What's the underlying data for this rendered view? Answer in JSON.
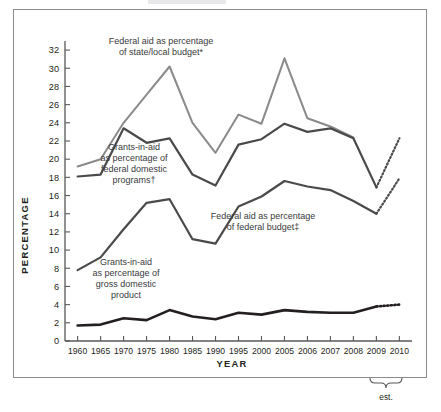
{
  "figure": {
    "frame_border_color": "#8c8c8e",
    "background": "#ffffff"
  },
  "axes": {
    "y_title": "PERCENTAGE",
    "x_title": "YEAR",
    "y_ticks": [
      0,
      2,
      4,
      6,
      8,
      10,
      12,
      14,
      16,
      18,
      20,
      22,
      24,
      26,
      28,
      30,
      32
    ],
    "x_ticks": [
      "1960",
      "1965",
      "1970",
      "1975",
      "1980",
      "1985",
      "1990",
      "1995",
      "2000",
      "2005",
      "2006",
      "2007",
      "2008",
      "2009",
      "2010"
    ],
    "est_bracket_label": "est."
  },
  "annotations": {
    "state_local": {
      "line1": "Federal aid as percentage",
      "line2": "of state/local budget*"
    },
    "domestic_programs": {
      "line1": "Grants-in-aid",
      "line2": "as percentage of",
      "line3": "federal domestic",
      "line4": "programs†"
    },
    "federal_budget": {
      "line1": "Federal aid as percentage",
      "line2": "of federal budget‡"
    },
    "gdp": {
      "line1": "Grants-in-aid",
      "line2": "as percentage of",
      "line3": "gross domestic",
      "line4": "product"
    }
  },
  "chart_data": {
    "type": "line",
    "title": "",
    "xlabel": "YEAR",
    "ylabel": "PERCENTAGE",
    "ylim": [
      0,
      33
    ],
    "grid": false,
    "legend_position": "inline-annotations",
    "categories": [
      "1960",
      "1965",
      "1970",
      "1975",
      "1980",
      "1985",
      "1990",
      "1995",
      "2000",
      "2005",
      "2006",
      "2007",
      "2008",
      "2009",
      "2010"
    ],
    "series": [
      {
        "name": "Federal aid as percentage of state/local budget*",
        "color": "#8a8a8c",
        "width": 2.0,
        "values": [
          19.2,
          20.0,
          24.0,
          27.1,
          30.2,
          24.0,
          20.7,
          24.9,
          23.9,
          31.1,
          24.5,
          23.6,
          22.4,
          null,
          null
        ],
        "note": "series ends at 2008, no estimate segment"
      },
      {
        "name": "Grants-in-aid as percentage of federal domestic programs†",
        "color": "#4a4a4c",
        "width": 2.2,
        "values": [
          18.1,
          18.3,
          23.4,
          21.8,
          22.3,
          18.3,
          17.1,
          21.6,
          22.2,
          23.9,
          23.0,
          23.4,
          22.3,
          16.9,
          null
        ],
        "estimate": {
          "from": [
            2009,
            16.9
          ],
          "to": [
            2010,
            22.3
          ],
          "style": "dotted"
        }
      },
      {
        "name": "Federal aid as percentage of federal budget‡",
        "color": "#4a4a4c",
        "width": 2.2,
        "values": [
          7.8,
          9.2,
          12.3,
          15.2,
          15.6,
          11.2,
          10.7,
          14.8,
          15.9,
          17.6,
          17.0,
          16.6,
          15.4,
          14.0,
          null
        ],
        "estimate": {
          "from": [
            2009,
            14.0
          ],
          "to": [
            2010,
            17.9
          ],
          "style": "dotted"
        }
      },
      {
        "name": "Grants-in-aid as percentage of gross domestic product",
        "color": "#231f20",
        "width": 2.6,
        "values": [
          1.7,
          1.8,
          2.5,
          2.3,
          3.4,
          2.7,
          2.4,
          3.1,
          2.9,
          3.4,
          3.2,
          3.1,
          3.1,
          3.8,
          null
        ],
        "estimate": {
          "from": [
            2009,
            3.8
          ],
          "to": [
            2010,
            4.0
          ],
          "style": "dotted"
        }
      }
    ]
  }
}
